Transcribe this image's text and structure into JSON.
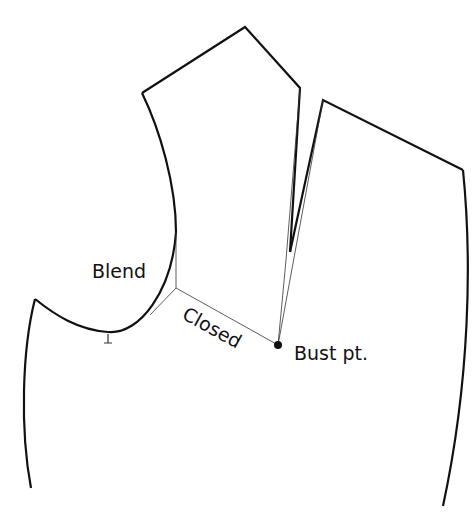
{
  "diagram": {
    "type": "sewing-pattern-bodice-dart-manipulation",
    "labels": {
      "blend": "Blend",
      "closed": "Closed",
      "bust_point": "Bust pt."
    },
    "colors": {
      "background": "#ffffff",
      "line": "#111111",
      "guide_line": "#333333"
    },
    "points": {
      "bust_point": [
        278,
        345
      ],
      "pivot_point": [
        176,
        288
      ]
    }
  }
}
